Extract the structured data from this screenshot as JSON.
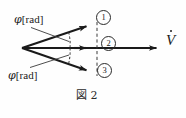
{
  "figure": {
    "caption": "図 2",
    "background_color": "#fefefe",
    "ink_color": "#1a1a1a",
    "labels": {
      "phi_symbol": "φ",
      "phi_unit": "[rad]",
      "phi_top_full": "φ [rad]",
      "phi_bottom_full": "φ [rad]",
      "axis_symbol": "V",
      "axis_full": "V̇"
    },
    "markers": [
      {
        "name": "vector-marker-1",
        "text": "①",
        "plain": "1"
      },
      {
        "name": "vector-marker-2",
        "text": "②",
        "plain": "2"
      },
      {
        "name": "vector-marker-3",
        "text": "③",
        "plain": "3"
      }
    ],
    "geometry": {
      "origin": {
        "x": 22,
        "y": 48
      },
      "vectors": [
        {
          "id": "1",
          "tip": {
            "x": 93,
            "y": 24
          },
          "label": "①"
        },
        {
          "id": "2",
          "tip": {
            "x": 163,
            "y": 48
          },
          "label": "②"
        },
        {
          "id": "3",
          "tip": {
            "x": 93,
            "y": 73
          },
          "label": "③"
        }
      ],
      "dashed_guide_line": {
        "x": 97,
        "y_top": 22,
        "y_bottom": 76
      },
      "angle_arcs": 2
    }
  }
}
